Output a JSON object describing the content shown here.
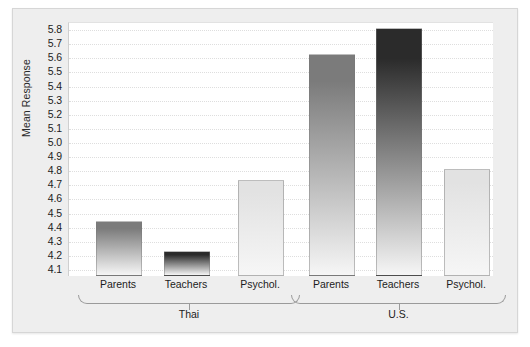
{
  "chart_data": {
    "type": "bar",
    "title": "",
    "xlabel": "",
    "ylabel": "Mean Response",
    "ylim": [
      4.05,
      5.85
    ],
    "ytick_start": 4.1,
    "ytick_end": 5.8,
    "ytick_step": 0.1,
    "yticks": [
      "5.8",
      "5.7",
      "5.6",
      "5.5",
      "5.4",
      "5.3",
      "5.2",
      "5.1",
      "5.0",
      "4.9",
      "4.8",
      "4.7",
      "4.6",
      "4.5",
      "4.4",
      "4.3",
      "4.2",
      "4.1"
    ],
    "grid": true,
    "legend": "none",
    "groups": [
      {
        "name": "Thai",
        "categories": [
          "Parents",
          "Teachers",
          "Psychol."
        ],
        "values": [
          4.44,
          4.23,
          4.73
        ],
        "colors": [
          "#7b7b7b",
          "#2b2b2b",
          "#e2e2e2"
        ]
      },
      {
        "name": "U.S.",
        "categories": [
          "Parents",
          "Teachers",
          "Psychol."
        ],
        "values": [
          5.62,
          5.81,
          4.81
        ],
        "colors": [
          "#7b7b7b",
          "#2b2b2b",
          "#e2e2e2"
        ]
      }
    ]
  }
}
